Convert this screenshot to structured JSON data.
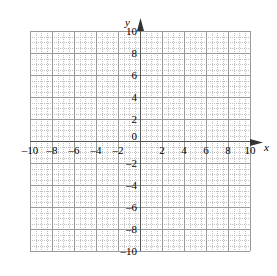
{
  "chart_data": {
    "type": "scatter",
    "title": "",
    "subtitle": "",
    "xlabel": "x",
    "ylabel": "y",
    "xlim": [
      -10,
      10
    ],
    "ylim": [
      -10,
      10
    ],
    "grid": true,
    "grid_major_step": 2,
    "grid_minor_step": 0.5,
    "legend": "none",
    "series": [],
    "x_tick_labels": [
      "–10",
      "–8",
      "–6",
      "–4",
      "–2",
      "0",
      "2",
      "4",
      "6",
      "8",
      "10"
    ],
    "x_tick_values": [
      -10,
      -8,
      -6,
      -4,
      -2,
      0,
      2,
      4,
      6,
      8,
      10
    ],
    "y_tick_labels": [
      "10",
      "8",
      "6",
      "4",
      "2",
      "–2",
      "–4",
      "–6",
      "–8",
      "–10"
    ],
    "y_tick_values": [
      10,
      8,
      6,
      4,
      2,
      -2,
      -4,
      -6,
      -8,
      -10
    ],
    "origin_label": "0",
    "annotations": []
  },
  "axes": {
    "x_name": "x",
    "y_name": "y",
    "x_arrow_icon": "arrow-right-icon",
    "y_arrow_icon": "arrow-up-icon"
  },
  "colors": {
    "background": "#ffffff",
    "axis": "#555555",
    "grid_major": "#9a9a9a",
    "grid_minor": "#c0c0c0",
    "text": "#000000"
  }
}
